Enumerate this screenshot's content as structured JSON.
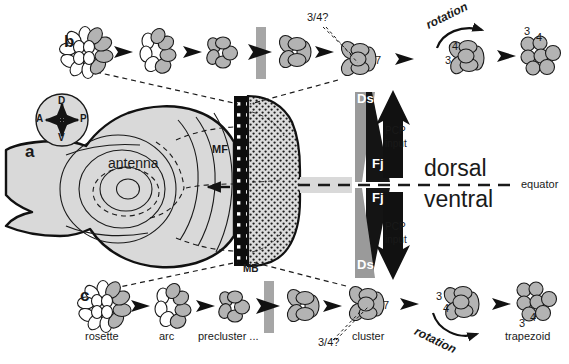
{
  "figure": {
    "panels": [
      {
        "id": "a",
        "letter": "a"
      },
      {
        "id": "b",
        "letter": "b"
      },
      {
        "id": "c",
        "letter": "c"
      }
    ]
  },
  "compass": {
    "name": "axis-compass",
    "dorsal": "D",
    "ventral": "V",
    "anterior": "A",
    "posterior": "P"
  },
  "disc": {
    "antenna_label": "antenna",
    "mf_label": "MF",
    "mb_label": "MB",
    "fill_color": "#d9d9d9",
    "furrow_color": "#111111",
    "stipple_color": "#d9d9d9"
  },
  "axes": {
    "dorsal": "dorsal",
    "ventral": "ventral",
    "equator": "equator"
  },
  "gradients": {
    "ds_label": "Ds",
    "fj_label": "Fj",
    "ds_color": "#9a9a9a",
    "fj_color": "#141414",
    "pcp_label_line1": "PCP",
    "pcp_label_line2": "input",
    "dorsal_pcp_arrow_direction": "up",
    "ventral_pcp_arrow_direction": "down"
  },
  "row_b": {
    "letter": "b",
    "question_label": "3/4?",
    "seven_label": "7",
    "rotation_label": "rotation",
    "photoreceptor_3": "3",
    "photoreceptor_4": "4",
    "trapezoid_3": "3",
    "trapezoid_4": "4",
    "stages": [
      "rosette",
      "arc",
      "precluster",
      "cluster",
      "rotation",
      "trapezoid"
    ]
  },
  "row_c": {
    "letter": "c",
    "stage_labels": [
      "rosette",
      "arc",
      "precluster ...",
      "cluster",
      "trapezoid"
    ],
    "question_label": "3/4?",
    "seven_label": "7",
    "rotation_label": "rotation",
    "photoreceptor_3": "3",
    "photoreceptor_4": "4",
    "trapezoid_3": "3",
    "trapezoid_4": "4"
  },
  "colors": {
    "cell_gray": "#b3b3b3",
    "cell_light": "#ffffff",
    "outline": "#1a1a1a",
    "band_gray": "#a6a6a6"
  }
}
